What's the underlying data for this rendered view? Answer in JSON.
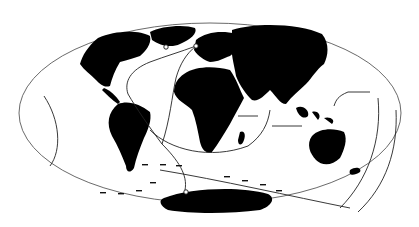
{
  "map": {
    "projection": "elliptical world map (Mollweide-like)",
    "background": "#ffffff",
    "land_color": "#000000",
    "route_color": "#222222",
    "outline_color": "#444444",
    "labels": [],
    "features": {
      "continents": [
        "North America",
        "South America",
        "Europe",
        "Africa",
        "Asia",
        "Australia",
        "Antarctica",
        "Greenland",
        "Madagascar",
        "New Zealand"
      ],
      "routes": [
        {
          "name": "north-atlantic-route",
          "from": "Antarctic waters",
          "to": "Arctic / northern Europe",
          "markers": "open circles at breeding sites"
        },
        {
          "name": "south-atlantic-loop",
          "from": "Southern Ocean",
          "to": "southern Africa"
        },
        {
          "name": "indian-ocean-route",
          "from": "Australia/Indonesia",
          "to": "East Africa"
        },
        {
          "name": "pacific-east-route",
          "from": "Southern Ocean",
          "to": "north-west Pacific"
        },
        {
          "name": "eastern-pacific-route",
          "from": "south-east Pacific",
          "to": "central Pacific"
        },
        {
          "name": "southern-ocean-dashed",
          "from": "South America",
          "to": "Indian Ocean",
          "style": "dashed arrows"
        }
      ]
    }
  }
}
